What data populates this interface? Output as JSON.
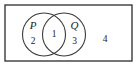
{
  "figure": {
    "type": "venn-diagram",
    "stroke_color": "#3a3a3a",
    "background_color": "#ffffff",
    "text_color": "#1a1a1a",
    "universe": {
      "name": "universal-set-rectangle",
      "x": 5,
      "y": 5,
      "width": 127,
      "height": 56
    },
    "sets": [
      {
        "label": "P",
        "name": "set-p",
        "cx": 44,
        "cy": 34.5,
        "r": 21.5,
        "label_x": 33,
        "label_y": 26
      },
      {
        "label": "Q",
        "name": "set-q",
        "cx": 64,
        "cy": 34.5,
        "r": 21.5,
        "label_x": 74.5,
        "label_y": 26
      }
    ],
    "regions": [
      {
        "label": "2",
        "name": "region-p-only",
        "x": 33,
        "y": 41
      },
      {
        "label": "1",
        "name": "region-intersection",
        "x": 54,
        "y": 34.5
      },
      {
        "label": "3",
        "name": "region-q-only",
        "x": 74.5,
        "y": 41
      },
      {
        "label": "4",
        "name": "region-outside",
        "x": 105,
        "y": 39
      }
    ]
  }
}
